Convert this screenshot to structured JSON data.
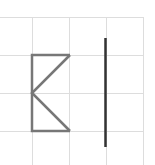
{
  "canvas": {
    "width": 155,
    "height": 165,
    "background": "#ffffff"
  },
  "grid": {
    "color": "#dddddd",
    "horizontal_lines_y": [
      17,
      55,
      93,
      131
    ],
    "vertical_lines_x": [
      32,
      69,
      106,
      143
    ],
    "x_start": 0,
    "x_end": 143,
    "y_start": 17,
    "y_end": 165
  },
  "shapes": {
    "k_figure": {
      "color": "#777777",
      "stroke_width": 2.5,
      "points": "70,55 32,55 32,131 70,131",
      "diagonal_points": "70,55 32,93 70,131"
    },
    "vertical_line": {
      "color": "#333333",
      "stroke_width": 2.5,
      "x": 105.5,
      "y1": 38,
      "y2": 147
    }
  }
}
